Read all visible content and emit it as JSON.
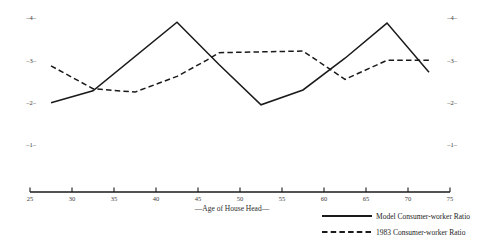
{
  "chart_data": {
    "type": "line",
    "title": "",
    "subtitle": "",
    "xlabel": "—Age of House Head—",
    "ylabel": "",
    "xlim": [
      25,
      75
    ],
    "ylim": [
      0.55,
      4.35
    ],
    "grid": false,
    "legend_position": "bottom-right",
    "x_ticks": [
      25,
      30,
      35,
      40,
      45,
      50,
      55,
      60,
      65,
      70,
      75
    ],
    "x_tick_labels": [
      "25",
      "30",
      "35",
      "40",
      "45",
      "50",
      "55",
      "60",
      "65",
      "70",
      "75"
    ],
    "y_ticks": [
      1,
      2,
      3,
      4
    ],
    "y_tick_labels_left": [
      "–1–",
      "–2–",
      "–3–",
      "–4–"
    ],
    "y_tick_labels_right": [
      "–1–",
      "–2–",
      "–3–",
      "–4–"
    ],
    "series": [
      {
        "name": "Model Consumer-worker Ratio",
        "style": "solid",
        "color": "#1a1a1a",
        "x": [
          27.5,
          32.5,
          42.5,
          47.5,
          52.5,
          57.5,
          62.5,
          67.5,
          72.5
        ],
        "values": [
          2.0,
          2.28,
          3.9,
          2.9,
          1.95,
          2.3,
          3.05,
          3.88,
          2.72
        ]
      },
      {
        "name": "1983 Consumer-worker Ratio",
        "style": "dashed",
        "color": "#1a1a1a",
        "x": [
          27.5,
          32.5,
          37.5,
          42.5,
          46.0,
          47.5,
          57.5,
          62.5,
          67.5,
          72.5
        ],
        "values": [
          2.87,
          2.33,
          2.25,
          2.62,
          3.0,
          3.18,
          3.22,
          2.55,
          3.0,
          3.0
        ]
      }
    ]
  },
  "legend": {
    "items": [
      {
        "label": "Model Consumer-worker Ratio",
        "style": "solid"
      },
      {
        "label": "1983 Consumer-worker Ratio",
        "style": "dashed"
      }
    ]
  },
  "axes": {
    "x_title": "—Age of House Head—"
  }
}
